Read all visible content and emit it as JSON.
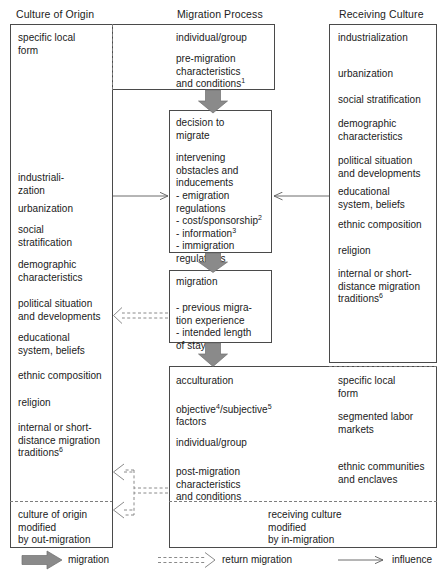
{
  "diagram": {
    "type": "flow-diagram"
  },
  "headers": {
    "left": "Culture of Origin",
    "center": "Migration Process",
    "right": "Receiving Culture"
  },
  "origin_column": {
    "top_item": "specific local\nform",
    "items": [
      "industriali-\nzation",
      "urbanization",
      "social\nstratification",
      "demographic\ncharacteristics",
      "political situation\nand developments",
      "educational\nsystem, beliefs",
      "ethnic composition",
      "religion",
      "internal or short-\ndistance migration\ntraditions"
    ],
    "items_sup": [
      "",
      "",
      "",
      "",
      "",
      "",
      "",
      "",
      "6"
    ],
    "outcome": "culture of origin\nmodified\nby out-migration"
  },
  "receiving_column": {
    "items": [
      "industrialization",
      "urbanization",
      "social stratification",
      "demographic\ncharacteristics",
      "political situation\nand developments",
      "educational\nsystem, beliefs",
      "ethnic composition",
      "religion",
      "internal or short-\ndistance migration\ntraditions"
    ],
    "items_sup": [
      "",
      "",
      "",
      "",
      "",
      "",
      "",
      "",
      "6"
    ],
    "outcome": "receiving culture\nmodified\nby in-migration"
  },
  "center_column": {
    "premigration": {
      "line1": "individual/group",
      "line2": "pre-migration\ncharacteristics\nand conditions",
      "line2_sup": "1"
    },
    "decision": {
      "heading": "decision to\nmigrate",
      "subheading": "intervening\nobstacles and\ninducements",
      "bullets": [
        {
          "text": "- emigration\n  regulations",
          "sup": ""
        },
        {
          "text": "- cost/sponsorship",
          "sup": "2"
        },
        {
          "text": "- information",
          "sup": "3"
        },
        {
          "text": "- immigration\n  regulations",
          "sup": ""
        }
      ]
    },
    "migration": {
      "heading": "migration",
      "bullets": [
        "- previous migra-\n  tion experience",
        "- intended length\n  of stay"
      ]
    },
    "acculturation": {
      "line1": "acculturation",
      "line2_a": "objective",
      "line2_a_sup": "4",
      "line2_b": "/subjective",
      "line2_b_sup": "5",
      "line2_c": "factors",
      "line3": "individual/group",
      "line4": "post-migration\ncharacteristics\nand conditions"
    },
    "receiving_outcomes": [
      "specific local\nform",
      "segmented labor\nmarkets",
      "ethnic communities\nand enclaves"
    ]
  },
  "legend": {
    "migration": "migration",
    "return_migration": "return migration",
    "influence": "influence"
  },
  "colors": {
    "arrow_fill": "#8a8a8a",
    "arrow_stroke": "#5c5c5c",
    "border": "#4a4a4a",
    "dashed": "#7d7d7d",
    "text": "#1a1a1a"
  }
}
